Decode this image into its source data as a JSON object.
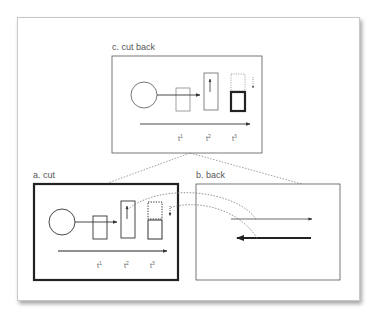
{
  "diagram": {
    "panels": {
      "c": {
        "label": "c. cut back",
        "ticks": [
          "t",
          "t",
          "t"
        ],
        "superscripts": [
          "1",
          "2",
          "3"
        ]
      },
      "a": {
        "label": "a. cut",
        "ticks": [
          "t",
          "t",
          "t"
        ],
        "superscripts": [
          "1",
          "2",
          "3"
        ]
      },
      "b": {
        "label": "b. back"
      }
    },
    "colors": {
      "stroke": "#555555",
      "thick_stroke": "#222222",
      "dotted": "#777777",
      "background": "#ffffff",
      "frame_border": "#c8c8c8"
    }
  }
}
